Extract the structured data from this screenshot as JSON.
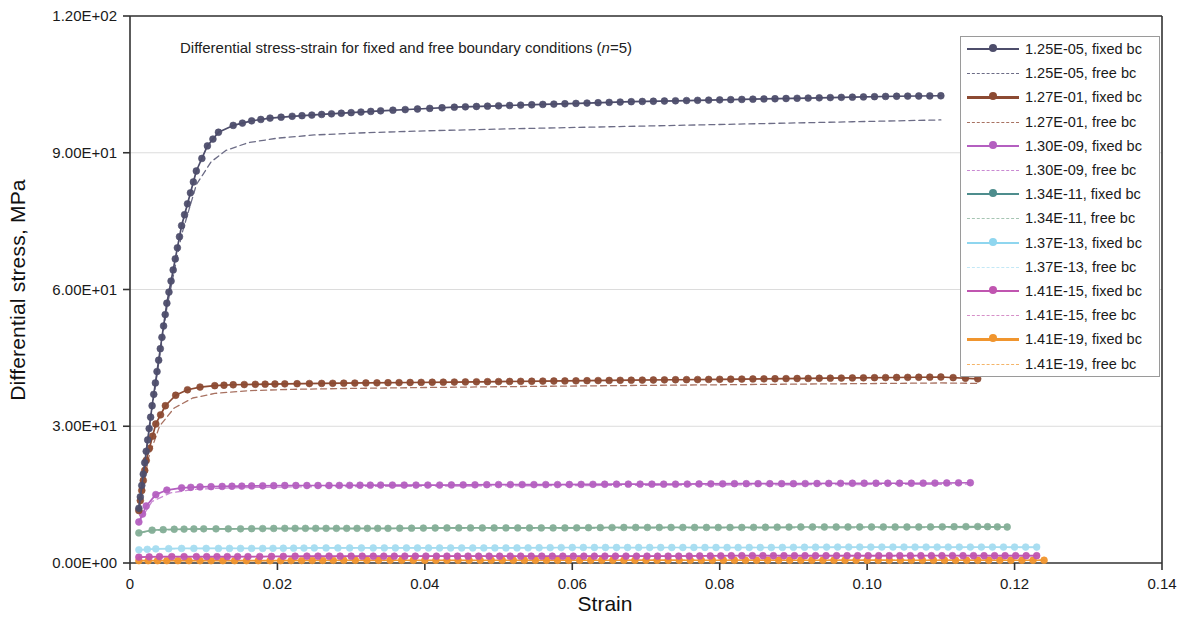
{
  "chart_data": {
    "type": "line",
    "title": "Differential stress-strain for fixed and free boundary conditions (n=5)",
    "title_prefix": "Differential stress-strain for fixed and free boundary conditions (",
    "title_italic": "n",
    "title_suffix": "=5)",
    "xlabel": "Strain",
    "ylabel": "Differential stress, MPa",
    "xlim": [
      0,
      0.14
    ],
    "ylim": [
      0,
      120
    ],
    "grid": true,
    "legend_position": "top-right inside",
    "xticks": [
      0,
      0.02,
      0.04,
      0.06,
      0.08,
      0.1,
      0.12,
      0.14
    ],
    "xticklabels": [
      "0",
      "0.02",
      "0.04",
      "0.06",
      "0.08",
      "0.10",
      "0.12",
      "0.14"
    ],
    "yticks": [
      0,
      30,
      60,
      90,
      120
    ],
    "yticklabels": [
      "0.00E+00",
      "3.00E+01",
      "6.00E+01",
      "9.00E+01",
      "1.20E+02"
    ],
    "series": [
      {
        "name": "1.25E-05, fixed bc",
        "color": "#4d4d6b",
        "style": "solid",
        "markers": true,
        "x": [
          0.0012,
          0.003,
          0.005,
          0.007,
          0.009,
          0.0105,
          0.012,
          0.014,
          0.0165,
          0.019,
          0.022,
          0.026,
          0.03,
          0.034,
          0.039,
          0.044,
          0.05,
          0.056,
          0.062,
          0.068,
          0.074,
          0.08,
          0.086,
          0.092,
          0.098,
          0.104,
          0.11
        ],
        "y": [
          12.0,
          34.5,
          57.0,
          74.0,
          86.0,
          91.5,
          94.5,
          96.0,
          97.0,
          97.6,
          98.0,
          98.4,
          98.8,
          99.2,
          99.6,
          100.0,
          100.3,
          100.6,
          100.9,
          101.2,
          101.4,
          101.6,
          101.8,
          102.0,
          102.2,
          102.4,
          102.5
        ]
      },
      {
        "name": "1.25E-05, free bc",
        "color": "#6c6c86",
        "style": "dashed",
        "markers": false,
        "x": [
          0.0012,
          0.003,
          0.005,
          0.007,
          0.009,
          0.011,
          0.013,
          0.016,
          0.02,
          0.025,
          0.032,
          0.04,
          0.05,
          0.062,
          0.074,
          0.086,
          0.098,
          0.11
        ],
        "y": [
          12.0,
          34.0,
          56.0,
          72.0,
          83.0,
          88.0,
          90.5,
          92.2,
          93.2,
          93.9,
          94.4,
          94.8,
          95.2,
          95.6,
          96.0,
          96.4,
          96.8,
          97.2
        ]
      },
      {
        "name": "1.27E-01, fixed bc",
        "color": "#8c4a32",
        "style": "solid",
        "markers": true,
        "x": [
          0.0012,
          0.0022,
          0.0035,
          0.0048,
          0.0062,
          0.0078,
          0.0095,
          0.0115,
          0.014,
          0.017,
          0.021,
          0.026,
          0.032,
          0.038,
          0.044,
          0.05,
          0.056,
          0.062,
          0.068,
          0.074,
          0.08,
          0.086,
          0.092,
          0.098,
          0.104,
          0.11,
          0.115
        ],
        "y": [
          11.5,
          22.5,
          30.5,
          34.5,
          36.8,
          38.0,
          38.6,
          38.9,
          39.1,
          39.2,
          39.3,
          39.4,
          39.5,
          39.6,
          39.7,
          39.8,
          39.9,
          40.0,
          40.1,
          40.2,
          40.3,
          40.4,
          40.5,
          40.6,
          40.7,
          40.8,
          40.4
        ]
      },
      {
        "name": "1.27E-01, free bc",
        "color": "#a87262",
        "style": "dashed",
        "markers": false,
        "x": [
          0.0012,
          0.0025,
          0.004,
          0.006,
          0.0085,
          0.0115,
          0.016,
          0.022,
          0.03,
          0.04,
          0.052,
          0.065,
          0.08,
          0.095,
          0.11,
          0.115
        ],
        "y": [
          11.5,
          23.0,
          30.0,
          34.0,
          36.2,
          37.2,
          37.8,
          38.1,
          38.3,
          38.5,
          38.7,
          38.9,
          39.1,
          39.3,
          39.5,
          39.4
        ]
      },
      {
        "name": "1.30E-09, fixed bc",
        "color": "#b45fc0",
        "style": "solid",
        "markers": true,
        "x": [
          0.0012,
          0.0022,
          0.0035,
          0.005,
          0.007,
          0.0095,
          0.0125,
          0.0165,
          0.021,
          0.027,
          0.034,
          0.042,
          0.05,
          0.058,
          0.066,
          0.074,
          0.082,
          0.09,
          0.098,
          0.106,
          0.114
        ],
        "y": [
          9.0,
          12.5,
          15.0,
          16.0,
          16.5,
          16.7,
          16.8,
          16.9,
          17.0,
          17.0,
          17.1,
          17.1,
          17.2,
          17.2,
          17.3,
          17.3,
          17.4,
          17.4,
          17.5,
          17.5,
          17.6
        ]
      },
      {
        "name": "1.30E-09, free bc",
        "color": "#c98ad2",
        "style": "dashed",
        "markers": false,
        "x": [
          0.0012,
          0.003,
          0.0055,
          0.009,
          0.014,
          0.022,
          0.033,
          0.047,
          0.062,
          0.078,
          0.095,
          0.114
        ],
        "y": [
          9.0,
          13.5,
          15.4,
          16.2,
          16.5,
          16.7,
          16.8,
          16.9,
          17.0,
          17.1,
          17.2,
          17.3
        ]
      },
      {
        "name": "1.34E-11, fixed bc",
        "color": "#84ae97",
        "style": "solid",
        "markers": true,
        "x": [
          0.0012,
          0.003,
          0.006,
          0.01,
          0.015,
          0.021,
          0.028,
          0.035,
          0.043,
          0.051,
          0.059,
          0.067,
          0.075,
          0.083,
          0.091,
          0.099,
          0.107,
          0.115,
          0.119
        ],
        "y": [
          6.6,
          7.2,
          7.4,
          7.5,
          7.5,
          7.6,
          7.6,
          7.6,
          7.7,
          7.7,
          7.7,
          7.8,
          7.8,
          7.8,
          7.9,
          7.9,
          7.9,
          8.0,
          7.9
        ]
      },
      {
        "name": "1.34E-11, free bc",
        "color": "#a6c5b3",
        "style": "dashed",
        "markers": false,
        "x": [
          0.0012,
          0.004,
          0.009,
          0.017,
          0.028,
          0.042,
          0.058,
          0.076,
          0.095,
          0.115,
          0.119
        ],
        "y": [
          6.6,
          7.2,
          7.4,
          7.5,
          7.5,
          7.6,
          7.6,
          7.7,
          7.7,
          7.8,
          7.8
        ]
      },
      {
        "name": "1.37E-13, fixed bc",
        "color": "#a5dcf0",
        "style": "solid",
        "markers": true,
        "x": [
          0.0012,
          0.0035,
          0.007,
          0.012,
          0.018,
          0.025,
          0.033,
          0.042,
          0.051,
          0.06,
          0.069,
          0.078,
          0.087,
          0.096,
          0.105,
          0.114,
          0.123
        ],
        "y": [
          2.9,
          3.1,
          3.2,
          3.2,
          3.2,
          3.3,
          3.3,
          3.3,
          3.3,
          3.4,
          3.4,
          3.4,
          3.4,
          3.5,
          3.5,
          3.5,
          3.5
        ]
      },
      {
        "name": "1.37E-13, free bc",
        "color": "#c3e8f6",
        "style": "dashed",
        "markers": false,
        "x": [
          0.0012,
          0.005,
          0.011,
          0.02,
          0.033,
          0.048,
          0.065,
          0.084,
          0.103,
          0.123
        ],
        "y": [
          2.9,
          3.1,
          3.2,
          3.2,
          3.3,
          3.3,
          3.3,
          3.4,
          3.4,
          3.4
        ]
      },
      {
        "name": "1.41E-15, fixed bc",
        "color": "#c055b0",
        "style": "solid",
        "markers": true,
        "x": [
          0.0012,
          0.004,
          0.009,
          0.016,
          0.024,
          0.033,
          0.043,
          0.053,
          0.063,
          0.073,
          0.083,
          0.093,
          0.103,
          0.113,
          0.123
        ],
        "y": [
          1.3,
          1.4,
          1.4,
          1.4,
          1.5,
          1.5,
          1.5,
          1.5,
          1.5,
          1.5,
          1.6,
          1.6,
          1.6,
          1.6,
          1.6
        ]
      },
      {
        "name": "1.41E-15, free bc",
        "color": "#d68fc8",
        "style": "dashed",
        "markers": false,
        "x": [
          0.0012,
          0.006,
          0.014,
          0.026,
          0.042,
          0.06,
          0.08,
          0.101,
          0.123
        ],
        "y": [
          1.3,
          1.4,
          1.4,
          1.4,
          1.5,
          1.5,
          1.5,
          1.5,
          1.6
        ]
      },
      {
        "name": "1.41E-19, fixed bc",
        "color": "#f0952e",
        "style": "solid",
        "markers": true,
        "x": [
          0.0012,
          0.005,
          0.011,
          0.019,
          0.029,
          0.04,
          0.052,
          0.064,
          0.076,
          0.088,
          0.1,
          0.112,
          0.124
        ],
        "y": [
          0.5,
          0.5,
          0.5,
          0.5,
          0.6,
          0.6,
          0.6,
          0.6,
          0.6,
          0.6,
          0.6,
          0.6,
          0.6
        ]
      },
      {
        "name": "1.41E-19, free bc",
        "color": "#f4b468",
        "style": "dashed",
        "markers": false,
        "x": [
          0.0012,
          0.007,
          0.016,
          0.03,
          0.047,
          0.067,
          0.089,
          0.112,
          0.124
        ],
        "y": [
          0.5,
          0.5,
          0.5,
          0.5,
          0.5,
          0.6,
          0.6,
          0.6,
          0.6
        ]
      }
    ]
  },
  "legend": {
    "items": [
      {
        "label": "1.25E-05, fixed bc",
        "color": "#4d4d6b",
        "style": "solid"
      },
      {
        "label": "1.25E-05, free bc",
        "color": "#6c6c86",
        "style": "dashed"
      },
      {
        "label": "1.27E-01, fixed bc",
        "color": "#8c4a32",
        "style": "solid"
      },
      {
        "label": "1.27E-01, free bc",
        "color": "#a87262",
        "style": "dashed"
      },
      {
        "label": "1.30E-09, fixed bc",
        "color": "#b45fc0",
        "style": "solid"
      },
      {
        "label": "1.30E-09, free bc",
        "color": "#c98ad2",
        "style": "dashed"
      },
      {
        "label": "1.34E-11, fixed bc",
        "color": "#4e8d8d",
        "style": "solid"
      },
      {
        "label": "1.34E-11, free bc",
        "color": "#a6c5b3",
        "style": "dashed"
      },
      {
        "label": "1.37E-13, fixed bc",
        "color": "#8fd6ef",
        "style": "solid"
      },
      {
        "label": "1.37E-13, free bc",
        "color": "#c3e8f6",
        "style": "dashed"
      },
      {
        "label": "1.41E-15, fixed bc",
        "color": "#c055b0",
        "style": "solid"
      },
      {
        "label": "1.41E-15, free bc",
        "color": "#d68fc8",
        "style": "dashed"
      },
      {
        "label": "1.41E-19, fixed bc",
        "color": "#f0952e",
        "style": "solid"
      },
      {
        "label": "1.41E-19, free bc",
        "color": "#f4b468",
        "style": "dashed"
      }
    ]
  }
}
